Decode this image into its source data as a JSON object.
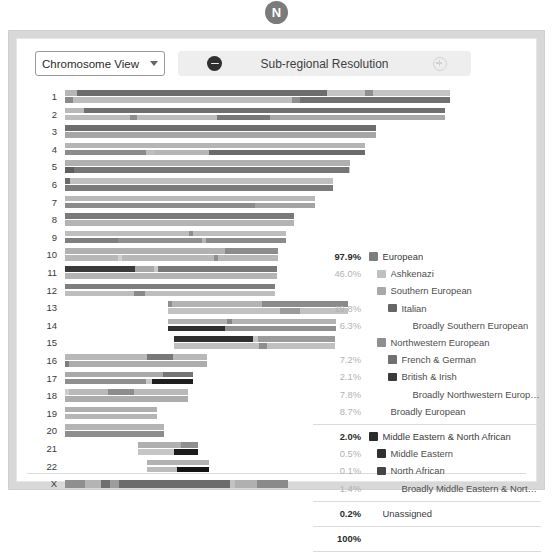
{
  "badge": {
    "label": "N"
  },
  "toolbar": {
    "view_select": {
      "value": "Chromosome View",
      "caret_icon": "chevron-down-icon"
    },
    "resolution": {
      "label": "Sub-regional Resolution",
      "minus_icon": "minus-circle-icon",
      "plus_icon": "plus-circle-icon"
    }
  },
  "chromosomes": [
    {
      "label": "1",
      "offset": 0.0,
      "length": 1.0
    },
    {
      "label": "2",
      "offset": 0.0,
      "length": 0.987
    },
    {
      "label": "3",
      "offset": 0.0,
      "length": 0.808
    },
    {
      "label": "4",
      "offset": 0.0,
      "length": 0.779
    },
    {
      "label": "5",
      "offset": 0.0,
      "length": 0.739
    },
    {
      "label": "6",
      "offset": 0.0,
      "length": 0.697
    },
    {
      "label": "7",
      "offset": 0.0,
      "length": 0.65
    },
    {
      "label": "8",
      "offset": 0.0,
      "length": 0.595
    },
    {
      "label": "9",
      "offset": 0.0,
      "length": 0.573
    },
    {
      "label": "10",
      "offset": 0.0,
      "length": 0.553
    },
    {
      "label": "11",
      "offset": 0.0,
      "length": 0.55
    },
    {
      "label": "12",
      "offset": 0.0,
      "length": 0.545
    },
    {
      "label": "13",
      "offset": 0.268,
      "length": 0.468
    },
    {
      "label": "14",
      "offset": 0.268,
      "length": 0.437
    },
    {
      "label": "15",
      "offset": 0.283,
      "length": 0.418
    },
    {
      "label": "16",
      "offset": 0.0,
      "length": 0.369
    },
    {
      "label": "17",
      "offset": 0.0,
      "length": 0.332
    },
    {
      "label": "18",
      "offset": 0.0,
      "length": 0.319
    },
    {
      "label": "19",
      "offset": 0.0,
      "length": 0.24
    },
    {
      "label": "20",
      "offset": 0.0,
      "length": 0.258
    },
    {
      "label": "21",
      "offset": 0.19,
      "length": 0.155
    },
    {
      "label": "22",
      "offset": 0.213,
      "length": 0.16
    },
    {
      "label": "X",
      "offset": 0.0,
      "length": 0.58
    }
  ],
  "chromosome_painting": {
    "base_color": "#c9c9c9",
    "haplotypes": [
      {
        "chr": "1",
        "strand": "a",
        "segments": [
          [
            0,
            3,
            "#b6b6b6"
          ],
          [
            3,
            68,
            "#6d6d6d"
          ],
          [
            68,
            78,
            "#c4c4c4"
          ],
          [
            78,
            80,
            "#8f8f8f"
          ],
          [
            80,
            100,
            "#c4c4c4"
          ]
        ]
      },
      {
        "chr": "1",
        "strand": "b",
        "segments": [
          [
            0,
            2,
            "#8a8a8a"
          ],
          [
            2,
            59,
            "#bdbdbd"
          ],
          [
            59,
            61,
            "#8f8f8f"
          ],
          [
            61,
            100,
            "#707070"
          ]
        ]
      },
      {
        "chr": "2",
        "strand": "a",
        "segments": [
          [
            0,
            5,
            "#b9b9b9"
          ],
          [
            5,
            100,
            "#707070"
          ]
        ]
      },
      {
        "chr": "2",
        "strand": "b",
        "segments": [
          [
            0,
            17,
            "#bcbcbc"
          ],
          [
            17,
            19,
            "#8d8d8d"
          ],
          [
            19,
            40,
            "#bcbcbc"
          ],
          [
            40,
            54,
            "#787878"
          ],
          [
            54,
            100,
            "#a8a8a8"
          ]
        ]
      },
      {
        "chr": "3",
        "strand": "a",
        "segments": [
          [
            0,
            100,
            "#6e6e6e"
          ]
        ]
      },
      {
        "chr": "3",
        "strand": "b",
        "segments": [
          [
            0,
            100,
            "#a6a6a6"
          ]
        ]
      },
      {
        "chr": "4",
        "strand": "a",
        "segments": [
          [
            0,
            100,
            "#b5b5b5"
          ]
        ]
      },
      {
        "chr": "4",
        "strand": "b",
        "segments": [
          [
            0,
            27,
            "#8b8b8b"
          ],
          [
            27,
            30,
            "#bdbdbd"
          ],
          [
            30,
            48,
            "#b5b5b5"
          ],
          [
            48,
            100,
            "#6b6b6b"
          ]
        ]
      },
      {
        "chr": "5",
        "strand": "a",
        "segments": [
          [
            0,
            100,
            "#b0b0b0"
          ]
        ]
      },
      {
        "chr": "5",
        "strand": "b",
        "segments": [
          [
            0,
            3,
            "#5e5e5e"
          ],
          [
            3,
            100,
            "#767676"
          ]
        ]
      },
      {
        "chr": "6",
        "strand": "a",
        "segments": [
          [
            0,
            2,
            "#6a6a6a"
          ],
          [
            2,
            100,
            "#c0c0c0"
          ]
        ]
      },
      {
        "chr": "6",
        "strand": "b",
        "segments": [
          [
            0,
            100,
            "#7b7b7b"
          ]
        ]
      },
      {
        "chr": "7",
        "strand": "a",
        "segments": [
          [
            0,
            100,
            "#b8b8b8"
          ]
        ]
      },
      {
        "chr": "7",
        "strand": "b",
        "segments": [
          [
            0,
            76,
            "#8b8b8b"
          ],
          [
            76,
            100,
            "#a3a3a3"
          ]
        ]
      },
      {
        "chr": "8",
        "strand": "a",
        "segments": [
          [
            0,
            100,
            "#7a7a7a"
          ]
        ]
      },
      {
        "chr": "8",
        "strand": "b",
        "segments": [
          [
            0,
            100,
            "#b4b4b4"
          ]
        ]
      },
      {
        "chr": "9",
        "strand": "a",
        "segments": [
          [
            0,
            56,
            "#bdbdbd"
          ],
          [
            56,
            58,
            "#8f8f8f"
          ],
          [
            58,
            100,
            "#bdbdbd"
          ]
        ]
      },
      {
        "chr": "9",
        "strand": "b",
        "segments": [
          [
            0,
            24,
            "#7f7f7f"
          ],
          [
            24,
            62,
            "#8f8f8f"
          ],
          [
            62,
            64,
            "#b5b5b5"
          ],
          [
            64,
            100,
            "#8a8a8a"
          ]
        ]
      },
      {
        "chr": "10",
        "strand": "a",
        "segments": [
          [
            0,
            75,
            "#b1b1b1"
          ],
          [
            75,
            100,
            "#8c8c8c"
          ]
        ]
      },
      {
        "chr": "10",
        "strand": "b",
        "segments": [
          [
            0,
            25,
            "#b8b8b8"
          ],
          [
            25,
            27,
            "#d0d0d0"
          ],
          [
            27,
            70,
            "#b8b8b8"
          ],
          [
            70,
            72,
            "#8f8f8f"
          ],
          [
            72,
            100,
            "#b8b8b8"
          ]
        ]
      },
      {
        "chr": "11",
        "strand": "a",
        "segments": [
          [
            0,
            33,
            "#3a3a3a"
          ],
          [
            33,
            42,
            "#a8a8a8"
          ],
          [
            42,
            44,
            "#cacaca"
          ],
          [
            44,
            100,
            "#787878"
          ]
        ]
      },
      {
        "chr": "11",
        "strand": "b",
        "segments": [
          [
            0,
            100,
            "#b4b4b4"
          ]
        ]
      },
      {
        "chr": "12",
        "strand": "a",
        "segments": [
          [
            0,
            100,
            "#7e7e7e"
          ]
        ]
      },
      {
        "chr": "12",
        "strand": "b",
        "segments": [
          [
            0,
            33,
            "#bdbdbd"
          ],
          [
            33,
            38,
            "#8a8a8a"
          ],
          [
            38,
            100,
            "#bdbdbd"
          ]
        ]
      },
      {
        "chr": "13",
        "strand": "a",
        "segments": [
          [
            0,
            2,
            "#8e8e8e"
          ],
          [
            2,
            52,
            "#b3b3b3"
          ],
          [
            52,
            100,
            "#8b8b8b"
          ]
        ]
      },
      {
        "chr": "13",
        "strand": "b",
        "segments": [
          [
            0,
            62,
            "#c2c2c2"
          ],
          [
            62,
            73,
            "#9a9a9a"
          ],
          [
            73,
            100,
            "#c2c2c2"
          ]
        ]
      },
      {
        "chr": "14",
        "strand": "a",
        "segments": [
          [
            0,
            35,
            "#b2b2b2"
          ],
          [
            35,
            38,
            "#868686"
          ],
          [
            38,
            100,
            "#b2b2b2"
          ]
        ]
      },
      {
        "chr": "14",
        "strand": "b",
        "segments": [
          [
            0,
            34,
            "#2e2e2e"
          ],
          [
            34,
            100,
            "#8f8f8f"
          ]
        ]
      },
      {
        "chr": "15",
        "strand": "a",
        "segments": [
          [
            0,
            49,
            "#2f2f2f"
          ],
          [
            49,
            52,
            "#c6c6c6"
          ],
          [
            52,
            100,
            "#9b9b9b"
          ]
        ]
      },
      {
        "chr": "15",
        "strand": "b",
        "segments": [
          [
            0,
            53,
            "#c0c0c0"
          ],
          [
            53,
            58,
            "#8e8e8e"
          ],
          [
            58,
            100,
            "#c0c0c0"
          ]
        ]
      },
      {
        "chr": "16",
        "strand": "a",
        "segments": [
          [
            0,
            58,
            "#b8b8b8"
          ],
          [
            58,
            76,
            "#787878"
          ],
          [
            76,
            100,
            "#b8b8b8"
          ]
        ]
      },
      {
        "chr": "16",
        "strand": "b",
        "segments": [
          [
            0,
            3,
            "#7d7d7d"
          ],
          [
            3,
            100,
            "#acacac"
          ]
        ]
      },
      {
        "chr": "17",
        "strand": "a",
        "segments": [
          [
            0,
            77,
            "#a9a9a9"
          ],
          [
            77,
            100,
            "#747474"
          ]
        ]
      },
      {
        "chr": "17",
        "strand": "b",
        "segments": [
          [
            0,
            63,
            "#8f8f8f"
          ],
          [
            63,
            68,
            "#c8c8c8"
          ],
          [
            68,
            100,
            "#1e1e1e"
          ]
        ]
      },
      {
        "chr": "18",
        "strand": "a",
        "segments": [
          [
            0,
            3,
            "#cdcdcd"
          ],
          [
            3,
            35,
            "#b9b9b9"
          ],
          [
            35,
            56,
            "#8d8d8d"
          ],
          [
            56,
            100,
            "#b9b9b9"
          ]
        ]
      },
      {
        "chr": "18",
        "strand": "b",
        "segments": [
          [
            0,
            100,
            "#adadad"
          ]
        ]
      },
      {
        "chr": "19",
        "strand": "a",
        "segments": [
          [
            0,
            100,
            "#b0b0b0"
          ]
        ]
      },
      {
        "chr": "19",
        "strand": "b",
        "segments": [
          [
            0,
            100,
            "#b6b6b6"
          ]
        ]
      },
      {
        "chr": "20",
        "strand": "a",
        "segments": [
          [
            0,
            100,
            "#b4b4b4"
          ]
        ]
      },
      {
        "chr": "20",
        "strand": "b",
        "segments": [
          [
            0,
            100,
            "#8d8d8d"
          ]
        ]
      },
      {
        "chr": "21",
        "strand": "a",
        "segments": [
          [
            0,
            72,
            "#b0b0b0"
          ],
          [
            72,
            100,
            "#8f8f8f"
          ]
        ]
      },
      {
        "chr": "21",
        "strand": "b",
        "segments": [
          [
            0,
            60,
            "#c6c6c6"
          ],
          [
            60,
            100,
            "#1c1c1c"
          ]
        ]
      },
      {
        "chr": "22",
        "strand": "a",
        "segments": [
          [
            0,
            100,
            "#b2b2b2"
          ]
        ]
      },
      {
        "chr": "22",
        "strand": "b",
        "segments": [
          [
            0,
            48,
            "#bcbcbc"
          ],
          [
            48,
            100,
            "#141414"
          ]
        ]
      },
      {
        "chr": "X",
        "strand": "a",
        "segments": [
          [
            0,
            9,
            "#8f8f8f"
          ],
          [
            9,
            16,
            "#b4b4b4"
          ],
          [
            16,
            20,
            "#6f6f6f"
          ],
          [
            20,
            24,
            "#9d9d9d"
          ],
          [
            24,
            74,
            "#6b6b6b"
          ],
          [
            74,
            76,
            "#c2c2c2"
          ],
          [
            76,
            86,
            "#b0b0b0"
          ],
          [
            86,
            100,
            "#8a8a8a"
          ]
        ]
      }
    ]
  },
  "legend": {
    "sections": [
      {
        "id": "european",
        "rows": [
          {
            "pct": "97.9%",
            "pct_style": "top",
            "swatch": "#7e7e7e",
            "name": "European",
            "indent": 0,
            "name_style": "top"
          },
          {
            "pct": "46.0%",
            "pct_style": "sub",
            "swatch": "#c0c0c0",
            "name": "Ashkenazi",
            "indent": 1
          },
          {
            "pct": "",
            "pct_style": "sub",
            "swatch": "#a9a9a9",
            "name": "Southern European",
            "indent": 1
          },
          {
            "pct": "19.8%",
            "pct_style": "sub",
            "swatch": "#666666",
            "name": "Italian",
            "indent": 2
          },
          {
            "pct": "6.3%",
            "pct_style": "sub",
            "swatch": "",
            "name": "Broadly Southern European",
            "indent": 3
          },
          {
            "pct": "",
            "pct_style": "sub",
            "swatch": "#8f8f8f",
            "name": "Northwestern European",
            "indent": 1
          },
          {
            "pct": "7.2%",
            "pct_style": "sub",
            "swatch": "#707070",
            "name": "French & German",
            "indent": 2
          },
          {
            "pct": "2.1%",
            "pct_style": "sub",
            "swatch": "#3a3a3a",
            "name": "British & Irish",
            "indent": 2
          },
          {
            "pct": "7.8%",
            "pct_style": "sub",
            "swatch": "",
            "name": "Broadly Northwestern European",
            "indent": 3
          },
          {
            "pct": "8.7%",
            "pct_style": "sub",
            "swatch": "",
            "name": "Broadly European",
            "indent": 1
          }
        ]
      },
      {
        "id": "mena",
        "rows": [
          {
            "pct": "2.0%",
            "pct_style": "top",
            "swatch": "#2b2b2b",
            "name": "Middle Eastern & North African",
            "indent": 0,
            "name_style": "top"
          },
          {
            "pct": "0.5%",
            "pct_style": "sub",
            "swatch": "#303030",
            "name": "Middle Eastern",
            "indent": 1
          },
          {
            "pct": "0.1%",
            "pct_style": "sub",
            "swatch": "#454545",
            "name": "North African",
            "indent": 1
          },
          {
            "pct": "1.4%",
            "pct_style": "sub",
            "swatch": "",
            "name": "Broadly Middle Eastern & North Afric…",
            "indent": 2
          }
        ]
      },
      {
        "id": "unassigned",
        "rows": [
          {
            "pct": "0.2%",
            "pct_style": "top",
            "swatch": "",
            "name": "Unassigned",
            "indent": 0,
            "name_style": "top"
          }
        ]
      },
      {
        "id": "total",
        "rows": [
          {
            "pct": "100%",
            "pct_style": "top",
            "swatch": "",
            "name": "",
            "indent": 0
          }
        ]
      }
    ]
  }
}
